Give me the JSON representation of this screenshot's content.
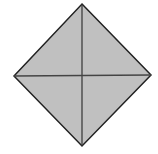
{
  "diagram": {
    "shape": "square-rotated-45",
    "fill_color": "#c0c0c0",
    "stroke_color": "#222222",
    "vertices": {
      "top": [
        82,
        4
      ],
      "right": [
        151,
        75
      ],
      "bottom": [
        82,
        146
      ],
      "left": [
        14,
        76
      ]
    },
    "diagonals": [
      {
        "from": "top",
        "to": "bottom"
      },
      {
        "from": "left",
        "to": "right"
      }
    ]
  }
}
